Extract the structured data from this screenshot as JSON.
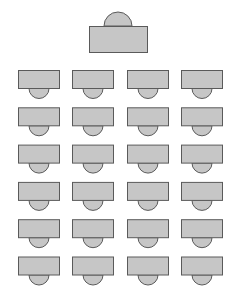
{
  "diagram": {
    "fill_color": "#c6c6c6",
    "stroke_color": "#5a5a5a",
    "background_color": "#ffffff",
    "teacher_desk": {
      "label": "Teacher desk",
      "chair_side": "top"
    },
    "student_grid": {
      "rows": 6,
      "columns": 4,
      "chair_side": "bottom",
      "label": "Student desk"
    }
  }
}
